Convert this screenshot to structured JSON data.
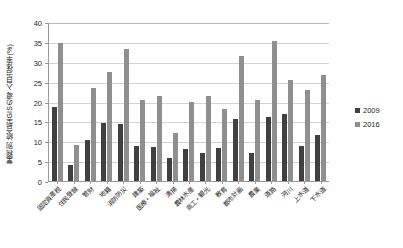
{
  "chart_data": {
    "type": "bar",
    "title": "",
    "ylabel": "業務別 統合型GISの導入自治体率(%)",
    "xlabel": "",
    "ylim": [
      0,
      40
    ],
    "yticks": [
      0,
      5,
      10,
      15,
      20,
      25,
      30,
      35,
      40
    ],
    "grid": true,
    "legend_position": "right",
    "categories": [
      "固定資産税",
      "住民登録",
      "管財",
      "地籍",
      "消防防災",
      "建築",
      "医療・福祉",
      "清掃",
      "農林水産",
      "商工・観光",
      "教育",
      "都市計画",
      "農業",
      "道路",
      "河川",
      "上水道",
      "下水道"
    ],
    "series": [
      {
        "name": "2009",
        "color": "#404040",
        "values": [
          18.5,
          4.0,
          10.3,
          14.5,
          14.3,
          8.8,
          8.5,
          5.8,
          8.0,
          7.0,
          8.3,
          15.5,
          7.0,
          16.0,
          16.8,
          8.7,
          11.5
        ]
      },
      {
        "name": "2016",
        "color": "#8f8f8f",
        "values": [
          34.7,
          9.0,
          23.4,
          27.3,
          33.3,
          20.4,
          21.4,
          12.0,
          20.0,
          21.4,
          18.0,
          31.5,
          20.5,
          35.2,
          25.5,
          22.8,
          26.6
        ]
      }
    ]
  },
  "legend": {
    "entries": [
      {
        "label": "2009",
        "color": "#404040"
      },
      {
        "label": "2016",
        "color": "#8f8f8f"
      }
    ]
  }
}
